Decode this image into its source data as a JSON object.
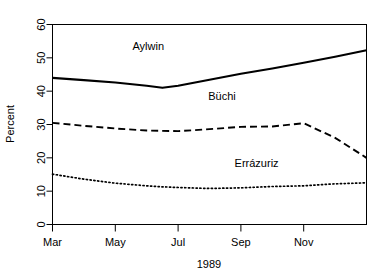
{
  "chart_data": {
    "type": "line",
    "title": "",
    "xlabel": "1989",
    "ylabel": "Percent",
    "xlim": [
      0,
      10
    ],
    "ylim": [
      0,
      60
    ],
    "grid": false,
    "legend_position": "inline-labels",
    "x_tick_labels": [
      "Mar",
      "May",
      "Jul",
      "Sep",
      "Nov"
    ],
    "x_tick_values": [
      0,
      2,
      4,
      6,
      8
    ],
    "y_tick_labels": [
      "0",
      "10",
      "20",
      "30",
      "40",
      "50",
      "60"
    ],
    "y_tick_values": [
      0,
      10,
      20,
      30,
      40,
      50,
      60
    ],
    "x": [
      0,
      1,
      2,
      3,
      3.5,
      4,
      5,
      6,
      7,
      8,
      9,
      10
    ],
    "series": [
      {
        "name": "Aylwin",
        "style": "solid",
        "color": "#000000",
        "label_x": 3.05,
        "label_y": 52.5,
        "values": [
          44.0,
          43.3,
          42.6,
          41.6,
          41.0,
          41.6,
          43.4,
          45.2,
          46.8,
          48.5,
          50.3,
          52.3
        ]
      },
      {
        "name": "Büchi",
        "style": "dashed",
        "color": "#000000",
        "label_x": 5.4,
        "label_y": 37.5,
        "values": [
          30.5,
          29.6,
          28.8,
          28.2,
          28.1,
          28.0,
          28.6,
          29.3,
          29.4,
          30.4,
          26.0,
          20.0
        ]
      },
      {
        "name": "Errázuriz",
        "style": "dotted",
        "color": "#000000",
        "label_x": 6.5,
        "label_y": 17.3,
        "values": [
          15.1,
          13.6,
          12.4,
          11.6,
          11.3,
          11.1,
          10.8,
          11.0,
          11.4,
          11.6,
          12.2,
          12.5
        ]
      }
    ]
  },
  "labels": {
    "y_axis_title": "Percent",
    "x_axis_title": "1989"
  }
}
